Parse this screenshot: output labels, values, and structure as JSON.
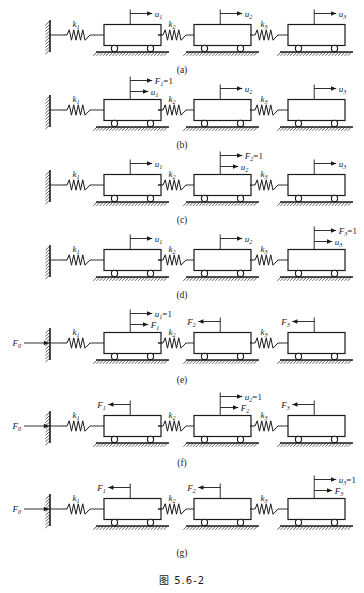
{
  "figure": {
    "caption": "图  5.6-2",
    "caption_label": "图",
    "caption_number": "5.6-2"
  },
  "diagram": {
    "type": "spring-mass-chain",
    "springs": [
      "k1",
      "k2",
      "k3"
    ],
    "carts": 3,
    "wall": "fixed-support-hatched",
    "ground": "hatched-ground"
  },
  "rows": [
    {
      "id": "a",
      "label": "(a)",
      "springs": [
        "k",
        "k",
        "k"
      ],
      "spring_subs": [
        "1",
        "2",
        "3"
      ],
      "wall_force": null,
      "wall_force_sub": null,
      "carts": [
        {
          "top": "u",
          "top_sub": "1",
          "top_eq": "",
          "top_dir": "right",
          "bottom": "",
          "bottom_sub": "",
          "bottom_dir": ""
        },
        {
          "top": "u",
          "top_sub": "2",
          "top_eq": "",
          "top_dir": "right",
          "bottom": "",
          "bottom_sub": "",
          "bottom_dir": ""
        },
        {
          "top": "u",
          "top_sub": "3",
          "top_eq": "",
          "top_dir": "right",
          "bottom": "",
          "bottom_sub": "",
          "bottom_dir": ""
        }
      ]
    },
    {
      "id": "b",
      "label": "(b)",
      "springs": [
        "k",
        "k",
        "k"
      ],
      "spring_subs": [
        "1",
        "2",
        "3"
      ],
      "wall_force": null,
      "wall_force_sub": null,
      "carts": [
        {
          "top": "F",
          "top_sub": "1",
          "top_eq": "=1",
          "top_dir": "right",
          "bottom": "u",
          "bottom_sub": "1",
          "bottom_dir": "right"
        },
        {
          "top": "u",
          "top_sub": "2",
          "top_eq": "",
          "top_dir": "right",
          "bottom": "",
          "bottom_sub": "",
          "bottom_dir": ""
        },
        {
          "top": "u",
          "top_sub": "3",
          "top_eq": "",
          "top_dir": "right",
          "bottom": "",
          "bottom_sub": "",
          "bottom_dir": ""
        }
      ]
    },
    {
      "id": "c",
      "label": "(c)",
      "springs": [
        "k",
        "k",
        "k"
      ],
      "spring_subs": [
        "1",
        "2",
        "3"
      ],
      "wall_force": null,
      "wall_force_sub": null,
      "carts": [
        {
          "top": "u",
          "top_sub": "1",
          "top_eq": "",
          "top_dir": "right",
          "bottom": "",
          "bottom_sub": "",
          "bottom_dir": ""
        },
        {
          "top": "F",
          "top_sub": "2",
          "top_eq": "=1",
          "top_dir": "right",
          "bottom": "u",
          "bottom_sub": "2",
          "bottom_dir": "right"
        },
        {
          "top": "u",
          "top_sub": "3",
          "top_eq": "",
          "top_dir": "right",
          "bottom": "",
          "bottom_sub": "",
          "bottom_dir": ""
        }
      ]
    },
    {
      "id": "d",
      "label": "(d)",
      "springs": [
        "k",
        "k",
        "k"
      ],
      "spring_subs": [
        "1",
        "2",
        "3"
      ],
      "wall_force": null,
      "wall_force_sub": null,
      "carts": [
        {
          "top": "u",
          "top_sub": "1",
          "top_eq": "",
          "top_dir": "right",
          "bottom": "",
          "bottom_sub": "",
          "bottom_dir": ""
        },
        {
          "top": "u",
          "top_sub": "2",
          "top_eq": "",
          "top_dir": "right",
          "bottom": "",
          "bottom_sub": "",
          "bottom_dir": ""
        },
        {
          "top": "F",
          "top_sub": "3",
          "top_eq": "=1",
          "top_dir": "right",
          "bottom": "u",
          "bottom_sub": "3",
          "bottom_dir": "right"
        }
      ]
    },
    {
      "id": "e",
      "label": "(e)",
      "springs": [
        "k",
        "k",
        "k"
      ],
      "spring_subs": [
        "1",
        "2",
        "3"
      ],
      "wall_force": "F",
      "wall_force_sub": "0",
      "carts": [
        {
          "top": "u",
          "top_sub": "1",
          "top_eq": "=1",
          "top_dir": "right",
          "bottom": "F",
          "bottom_sub": "1",
          "bottom_dir": "right"
        },
        {
          "top": "F",
          "top_sub": "2",
          "top_eq": "",
          "top_dir": "left",
          "bottom": "",
          "bottom_sub": "",
          "bottom_dir": ""
        },
        {
          "top": "F",
          "top_sub": "3",
          "top_eq": "",
          "top_dir": "left",
          "bottom": "",
          "bottom_sub": "",
          "bottom_dir": ""
        }
      ]
    },
    {
      "id": "f",
      "label": "(f)",
      "springs": [
        "k",
        "k",
        "k"
      ],
      "spring_subs": [
        "1",
        "2",
        "3"
      ],
      "wall_force": "F",
      "wall_force_sub": "0",
      "carts": [
        {
          "top": "F",
          "top_sub": "1",
          "top_eq": "",
          "top_dir": "left",
          "bottom": "",
          "bottom_sub": "",
          "bottom_dir": ""
        },
        {
          "top": "u",
          "top_sub": "2",
          "top_eq": "=1",
          "top_dir": "right",
          "bottom": "F",
          "bottom_sub": "2",
          "bottom_dir": "right"
        },
        {
          "top": "F",
          "top_sub": "3",
          "top_eq": "",
          "top_dir": "left",
          "bottom": "",
          "bottom_sub": "",
          "bottom_dir": ""
        }
      ]
    },
    {
      "id": "g",
      "label": "(g)",
      "springs": [
        "k",
        "k",
        "k"
      ],
      "spring_subs": [
        "1",
        "2",
        "3"
      ],
      "wall_force": "F",
      "wall_force_sub": "0",
      "carts": [
        {
          "top": "F",
          "top_sub": "1",
          "top_eq": "",
          "top_dir": "left",
          "bottom": "",
          "bottom_sub": "",
          "bottom_dir": ""
        },
        {
          "top": "F",
          "top_sub": "2",
          "top_eq": "",
          "top_dir": "left",
          "bottom": "",
          "bottom_sub": "",
          "bottom_dir": ""
        },
        {
          "top": "u",
          "top_sub": "3",
          "top_eq": "=1",
          "top_dir": "right",
          "bottom": "F",
          "bottom_sub": "3",
          "bottom_dir": "right"
        }
      ]
    }
  ],
  "geometry": {
    "wall_x": 50,
    "cart_x": [
      104,
      194,
      288
    ],
    "cart_w": 57,
    "spring_x": [
      62,
      158,
      250
    ],
    "baseline_y": 47,
    "row_tops": [
      4,
      79,
      154,
      229,
      312,
      395,
      478
    ],
    "label_y": [
      65,
      140,
      215,
      290,
      375,
      458,
      548
    ],
    "caption_y": 572
  },
  "colors": {
    "ink": "#1a1a1a",
    "paper": "#ffffff"
  }
}
